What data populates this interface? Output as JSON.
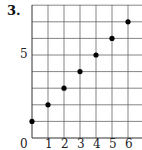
{
  "problem": {
    "number": "3."
  },
  "axes": {
    "x_ticks": [
      "0",
      "1",
      "2",
      "3",
      "4",
      "5",
      "6"
    ],
    "y_ticks": [
      "5"
    ]
  },
  "chart_data": {
    "type": "scatter",
    "title": "3.",
    "xlabel": "",
    "ylabel": "",
    "x": [
      0,
      1,
      2,
      3,
      4,
      5,
      6
    ],
    "y": [
      1,
      2,
      3,
      4,
      5,
      6,
      7
    ],
    "xlim": [
      0,
      7
    ],
    "ylim": [
      0,
      8
    ],
    "x_tick_labels": [
      "0",
      "1",
      "2",
      "3",
      "4",
      "5",
      "6"
    ],
    "y_tick_labels": [
      "5"
    ],
    "grid": true,
    "marker_color": "#000000",
    "grid_color": "#555555"
  }
}
